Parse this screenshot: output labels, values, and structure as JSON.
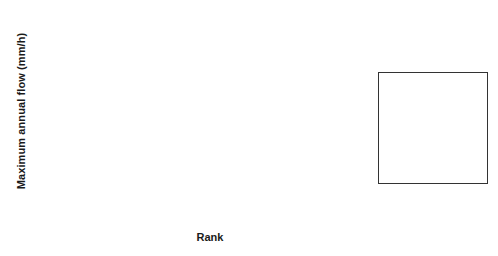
{
  "chart_data": {
    "type": "line",
    "title": "",
    "xlabel": "Rank",
    "ylabel": "Maximum annual flow (mm/h)",
    "x": [
      1,
      2,
      3,
      4,
      5,
      6,
      7,
      8,
      9
    ],
    "xlim": [
      1,
      9
    ],
    "ylim": [
      0,
      7
    ],
    "xticks": [
      "1",
      "2",
      "3",
      "4",
      "5",
      "6",
      "7",
      "8",
      "9"
    ],
    "yticks": [
      "0",
      "1",
      "2",
      "3",
      "4",
      "5",
      "6",
      "7"
    ],
    "grid": false,
    "legend_position": "right-outside",
    "series": [
      {
        "name": "D,PP",
        "style": "thick-solid",
        "color": "#000000",
        "values": [
          1.25,
          1.85,
          2.2,
          2.45,
          3.05,
          3.35,
          3.6,
          4.6,
          4.75
        ]
      },
      {
        "name": "UD,PP",
        "style": "thin-solid",
        "color": "#555555",
        "values": [
          1.9,
          2.6,
          2.8,
          3.0,
          3.4,
          3.55,
          4.15,
          4.7,
          5.4
        ]
      },
      {
        "name": "D,RS",
        "style": "dashed",
        "color": "#000000",
        "values": [
          0.95,
          1.9,
          2.25,
          2.35,
          2.75,
          2.8,
          3.85,
          4.75,
          5.5
        ]
      },
      {
        "name": "UD,RS",
        "style": "dotted",
        "color": "#000000",
        "values": [
          2.5,
          3.05,
          3.45,
          3.75,
          4.1,
          4.3,
          4.85,
          6.1,
          6.7
        ]
      }
    ]
  },
  "legend": {
    "items": [
      {
        "label": "D,PP",
        "style": "thick-solid"
      },
      {
        "label": "UD,PP",
        "style": "thin-solid"
      },
      {
        "label": "D,RS",
        "style": "dashed"
      },
      {
        "label": "UD,RS",
        "style": "dotted"
      }
    ]
  }
}
